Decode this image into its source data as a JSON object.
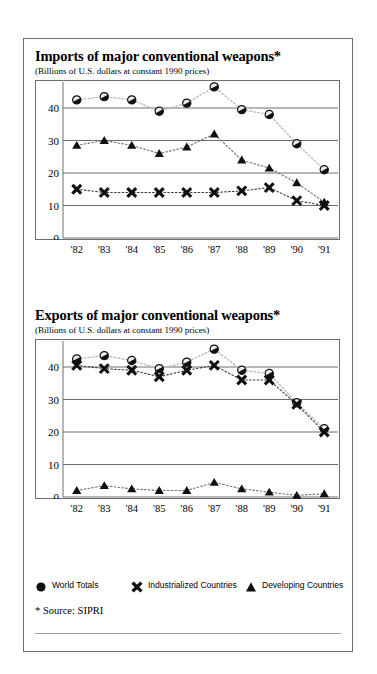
{
  "source_note": "* Source: SIPRI",
  "legend": [
    {
      "marker": "circle-marker-icon",
      "label": "World Totals"
    },
    {
      "marker": "x-cross-marker-icon",
      "label": "Industrialized Countries"
    },
    {
      "marker": "triangle-marker-icon",
      "label": "Developing Countries"
    }
  ],
  "panels": [
    {
      "title": "Imports of major conventional weapons*",
      "subtitle": "(Billions of U.S. dollars at constant 1990 prices)"
    },
    {
      "title": "Exports of major conventional weapons*",
      "subtitle": "(Billions of U.S. dollars at constant 1990 prices)"
    }
  ],
  "chart_data": [
    {
      "type": "line",
      "title": "Imports of major conventional weapons*",
      "subtitle": "(Billions of U.S. dollars at constant 1990 prices)",
      "xlabel": "",
      "ylabel": "Billions of U.S. dollars at constant 1990 prices",
      "categories": [
        "'82",
        "'83",
        "'84",
        "'85",
        "'86",
        "'87",
        "'88",
        "'89",
        "'90",
        "'91"
      ],
      "x": [
        1982,
        1983,
        1984,
        1985,
        1986,
        1987,
        1988,
        1989,
        1990,
        1991
      ],
      "ylim": [
        0,
        48
      ],
      "yticks": [
        0,
        10,
        20,
        30,
        40
      ],
      "grid": true,
      "legend_position": "below-figure",
      "series": [
        {
          "name": "World Totals",
          "marker": "circle",
          "values": [
            42.5,
            43.5,
            42.5,
            39.0,
            41.5,
            46.5,
            39.5,
            38.0,
            29.0,
            21.0
          ]
        },
        {
          "name": "Industrialized Countries",
          "marker": "x-cross",
          "values": [
            15.0,
            14.0,
            14.0,
            14.0,
            14.0,
            14.0,
            14.5,
            15.5,
            11.5,
            10.0
          ]
        },
        {
          "name": "Developing Countries",
          "marker": "triangle",
          "values": [
            28.5,
            30.0,
            28.5,
            26.0,
            28.0,
            32.0,
            24.0,
            21.5,
            17.0,
            11.0
          ]
        }
      ]
    },
    {
      "type": "line",
      "title": "Exports of major conventional weapons*",
      "subtitle": "(Billions of U.S. dollars at constant 1990 prices)",
      "xlabel": "",
      "ylabel": "Billions of U.S. dollars at constant 1990 prices",
      "categories": [
        "'82",
        "'83",
        "'84",
        "'85",
        "'86",
        "'87",
        "'88",
        "'89",
        "'90",
        "'91"
      ],
      "x": [
        1982,
        1983,
        1984,
        1985,
        1986,
        1987,
        1988,
        1989,
        1990,
        1991
      ],
      "ylim": [
        0,
        48
      ],
      "yticks": [
        0,
        10,
        20,
        30,
        40
      ],
      "grid": true,
      "legend_position": "below-figure",
      "series": [
        {
          "name": "World Totals",
          "marker": "circle",
          "values": [
            42.5,
            43.5,
            42.0,
            39.5,
            41.5,
            45.5,
            39.0,
            38.0,
            29.0,
            21.0
          ]
        },
        {
          "name": "Industrialized Countries",
          "marker": "x-cross",
          "values": [
            40.5,
            39.5,
            39.0,
            37.0,
            39.0,
            40.5,
            36.0,
            36.0,
            28.5,
            20.0
          ]
        },
        {
          "name": "Developing Countries",
          "marker": "triangle",
          "values": [
            2.0,
            3.5,
            2.5,
            2.0,
            2.0,
            4.5,
            2.5,
            1.5,
            0.5,
            1.0
          ]
        }
      ]
    }
  ]
}
